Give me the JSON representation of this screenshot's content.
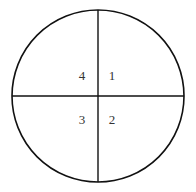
{
  "diagram": {
    "type": "circle-quadrants",
    "stroke_color": "#111111",
    "background": "#ffffff",
    "circle": {
      "cx": 98,
      "cy": 96,
      "r": 86
    },
    "quadrants": [
      {
        "label": "1",
        "position": "top-right",
        "x": 112,
        "y": 80
      },
      {
        "label": "2",
        "position": "bottom-right",
        "x": 112,
        "y": 124
      },
      {
        "label": "3",
        "position": "bottom-left",
        "x": 82,
        "y": 124
      },
      {
        "label": "4",
        "position": "top-left",
        "x": 82,
        "y": 80
      }
    ]
  }
}
